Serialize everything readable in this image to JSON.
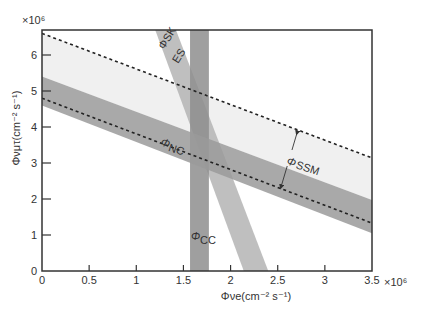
{
  "chart_data": {
    "type": "area",
    "title": "",
    "xlabel": "Φνe(cm⁻² s⁻¹)",
    "ylabel": "Φνμτ(cm⁻² s⁻¹)",
    "x_multiplier": "×10⁶",
    "y_multiplier": "×10⁶",
    "xlim": [
      0,
      3.5
    ],
    "ylim": [
      0,
      6.7
    ],
    "xticks": [
      0,
      0.5,
      1,
      1.5,
      2,
      2.5,
      3,
      3.5
    ],
    "xtick_labels": [
      "0",
      "0.5",
      "1",
      "1.5",
      "2",
      "2.5",
      "3",
      "3.5"
    ],
    "yticks": [
      0,
      1,
      2,
      3,
      4,
      5,
      6
    ],
    "ytick_labels": [
      "0",
      "1",
      "2",
      "3",
      "4",
      "5",
      "6"
    ],
    "grid": false,
    "series": [
      {
        "name": "ΦSSM region",
        "kind": "band",
        "color": "#f0f0f0",
        "upper": [
          [
            0,
            6.6
          ],
          [
            3.5,
            3.14
          ]
        ],
        "lower": [
          [
            0,
            5.4
          ],
          [
            3.5,
            1.97
          ]
        ]
      },
      {
        "name": "ΦNC",
        "kind": "band",
        "color": "#9a9a9a",
        "upper": [
          [
            0,
            5.4
          ],
          [
            3.5,
            1.97
          ]
        ],
        "lower": [
          [
            0,
            4.6
          ],
          [
            3.5,
            1.05
          ]
        ]
      },
      {
        "name": "ΦCC",
        "kind": "vertical-band",
        "color": "#8e8e8e",
        "x_range": [
          1.57,
          1.77
        ]
      },
      {
        "name": "ΦSK ES",
        "kind": "slanted-band",
        "color": "#b4b4b4",
        "top_x_range": [
          1.2,
          1.42
        ],
        "top_y": 6.7,
        "bottom_x_range": [
          2.14,
          2.4
        ],
        "bottom_y": 0
      },
      {
        "name": "SSM upper bound",
        "kind": "dashed-line",
        "points": [
          [
            0,
            6.6
          ],
          [
            3.5,
            3.14
          ]
        ]
      },
      {
        "name": "SSM lower bound",
        "kind": "dashed-line",
        "points": [
          [
            0,
            4.8
          ],
          [
            3.5,
            1.33
          ]
        ]
      }
    ],
    "annotations": [
      {
        "text": "ΦSK ES",
        "near": [
          1.35,
          6.2
        ]
      },
      {
        "text": "ΦNC",
        "near": [
          1.3,
          3.6
        ]
      },
      {
        "text": "ΦCC",
        "near": [
          1.6,
          0.9
        ]
      },
      {
        "text": "Φ SSM",
        "near": [
          2.65,
          3.1
        ],
        "arrow": "double, between dashed lines"
      }
    ]
  },
  "labels": {
    "x_axis": "Φνe(cm⁻² s⁻¹)",
    "y_axis": "Φνμτ(cm⁻² s⁻¹)",
    "x_mult": "×10⁶",
    "y_mult": "×10⁶",
    "sk": "ΦSK",
    "es": "ES",
    "nc_phi": "Φ",
    "nc_sub": "NC",
    "cc_phi": "Φ",
    "cc_sub": "CC",
    "ssm_phi": "Φ",
    "ssm_sub": "SSM"
  }
}
